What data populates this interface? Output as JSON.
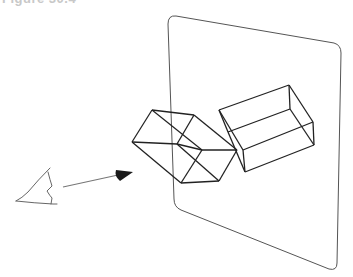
{
  "caption": {
    "text": "Figure 30.4"
  },
  "diagram": {
    "colors": {
      "stroke": "#222222",
      "plane": "#555555",
      "eye": "#666666",
      "arrow": "#777777",
      "cone": "#1a1a1a"
    },
    "elements": [
      {
        "id": "eye",
        "label": "viewer eye"
      },
      {
        "id": "view-ray",
        "label": "line of sight arrow"
      },
      {
        "id": "object-box",
        "label": "3D box (object)"
      },
      {
        "id": "projected-box",
        "label": "projected box image"
      },
      {
        "id": "picture-plane",
        "label": "projection plane"
      }
    ]
  }
}
